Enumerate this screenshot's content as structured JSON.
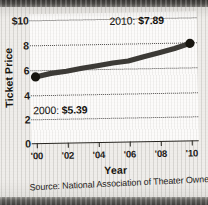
{
  "chart_data": {
    "type": "line",
    "title": "",
    "xlabel": "Year",
    "ylabel": "Ticket Price",
    "x": [
      2000,
      2001,
      2002,
      2003,
      2004,
      2005,
      2006,
      2007,
      2008,
      2009,
      2010
    ],
    "values": [
      5.39,
      5.66,
      5.81,
      6.03,
      6.21,
      6.41,
      6.55,
      6.88,
      7.18,
      7.5,
      7.89
    ],
    "series": [
      {
        "name": "Average movie ticket price",
        "values": [
          5.39,
          5.66,
          5.81,
          6.03,
          6.21,
          6.41,
          6.55,
          6.88,
          7.18,
          7.5,
          7.89
        ]
      }
    ],
    "xlim": [
      2000,
      2010
    ],
    "ylim": [
      0,
      10
    ],
    "ytick_labels": [
      "$10",
      "8",
      "6",
      "4",
      "2",
      "0"
    ],
    "ytick_values": [
      10,
      8,
      6,
      4,
      2,
      0
    ],
    "xtick_labels": [
      "'00",
      "'02",
      "'04",
      "'06",
      "'08",
      "'10"
    ],
    "xtick_values": [
      2000,
      2002,
      2004,
      2006,
      2008,
      2010
    ],
    "grid": true,
    "grid_style": "dotted-horizontal",
    "legend": "none",
    "annotations": [
      {
        "id": "start",
        "year": 2000,
        "label": "2000:",
        "value": "$5.39",
        "anchor_point": [
          2000,
          5.39
        ]
      },
      {
        "id": "end",
        "year": 2010,
        "label": "2010:",
        "value": "$7.89",
        "anchor_point": [
          2010,
          7.89
        ]
      }
    ],
    "source": "Source: National Association of Theater Owners",
    "colors": {
      "line": "#3c3a36",
      "marker": "#17150f",
      "grid": "#3a3836",
      "axis": "#26241f",
      "text": "#17150f",
      "plot_background": "#fcfbfa",
      "page_background": "#efedea"
    }
  },
  "axes": {
    "y": {
      "title": "Ticket Price",
      "ticks": [
        {
          "label": "$10",
          "value": 10
        },
        {
          "label": "8",
          "value": 8
        },
        {
          "label": "6",
          "value": 6
        },
        {
          "label": "4",
          "value": 4
        },
        {
          "label": "2",
          "value": 2
        },
        {
          "label": "0",
          "value": 0
        }
      ]
    },
    "x": {
      "title": "Year",
      "ticks": [
        {
          "label": "'00",
          "value": 2000
        },
        {
          "label": "'02",
          "value": 2002
        },
        {
          "label": "'04",
          "value": 2004
        },
        {
          "label": "'06",
          "value": 2006
        },
        {
          "label": "'08",
          "value": 2008
        },
        {
          "label": "'10",
          "value": 2010
        }
      ]
    }
  },
  "annotations": {
    "end": {
      "label": "2010:",
      "value": "$7.89"
    },
    "start": {
      "label": "2000:",
      "value": "$5.39"
    }
  },
  "footer": {
    "source": "Source: National Association of Theater Owners"
  }
}
